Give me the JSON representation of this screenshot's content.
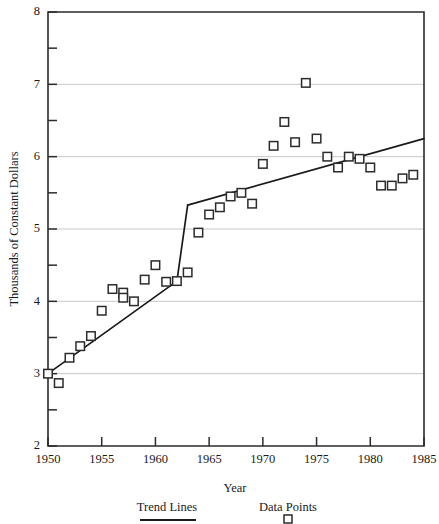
{
  "chart_data": {
    "type": "scatter",
    "title": "",
    "xlabel": "Year",
    "ylabel": "Thousands of Constant Dollars",
    "xlim": [
      1950,
      1985
    ],
    "ylim": [
      2,
      8
    ],
    "xticks": [
      1950,
      1955,
      1960,
      1965,
      1970,
      1975,
      1980,
      1985
    ],
    "xtick_labels": [
      "1950",
      "1955",
      "1960",
      "1965",
      "1970",
      "1975",
      "1980",
      "1985"
    ],
    "yticks": [
      2,
      3,
      4,
      5,
      6,
      7,
      8
    ],
    "ytick_labels": [
      "2",
      "3",
      "4",
      "5",
      "6",
      "7",
      "8"
    ],
    "yticks_minor": [
      2.5,
      3.5,
      4.5,
      5.5,
      6.5,
      7.5
    ],
    "grid": "horizontal-major",
    "legend_position": "below-axes",
    "series": [
      {
        "name": "Data Points",
        "type": "scatter",
        "marker": "square-open",
        "x": [
          1950,
          1951,
          1952,
          1953,
          1954,
          1955,
          1956,
          1957,
          1957,
          1958,
          1959,
          1960,
          1961,
          1962,
          1963,
          1964,
          1965,
          1966,
          1967,
          1968,
          1969,
          1970,
          1971,
          1972,
          1973,
          1974,
          1975,
          1976,
          1977,
          1978,
          1979,
          1980,
          1981,
          1982,
          1983,
          1984
        ],
        "y": [
          3.0,
          2.87,
          3.22,
          3.38,
          3.52,
          3.87,
          4.17,
          4.12,
          4.05,
          4.0,
          4.3,
          4.5,
          4.27,
          4.28,
          4.4,
          4.95,
          5.2,
          5.3,
          5.45,
          5.5,
          5.35,
          5.9,
          6.15,
          6.48,
          6.2,
          7.02,
          6.25,
          6.0,
          5.85,
          6.0,
          5.97,
          5.85,
          5.6,
          5.6,
          5.7,
          5.75
        ]
      },
      {
        "name": "Trend Lines",
        "type": "line",
        "segments": [
          {
            "name": "pre-break-trend",
            "x": [
              1950,
              1962
            ],
            "y": [
              3.0,
              4.28
            ]
          },
          {
            "name": "break-rise",
            "x": [
              1962,
              1963
            ],
            "y": [
              4.28,
              5.33
            ]
          },
          {
            "name": "post-break-trend",
            "x": [
              1963,
              1985
            ],
            "y": [
              5.33,
              6.25
            ]
          }
        ]
      }
    ]
  },
  "legend": {
    "entries": [
      {
        "label": "Trend Lines",
        "swatch": "line"
      },
      {
        "label": "Data Points",
        "swatch": "square-open"
      }
    ]
  },
  "colors": {
    "axis": "#2b2b2b",
    "grid": "#b9b9b9",
    "line": "#1a1a1a",
    "marker_stroke": "#2b2b2b",
    "marker_fill": "#ffffff",
    "background": "#ffffff"
  }
}
